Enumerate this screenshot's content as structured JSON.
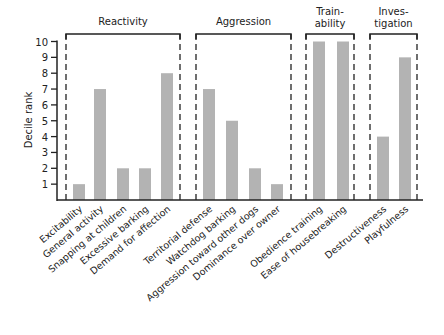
{
  "chart_data": {
    "type": "bar",
    "title": "",
    "xlabel": "",
    "ylabel": "Decile rank",
    "ylim": [
      0,
      10
    ],
    "yticks": [
      1,
      2,
      3,
      4,
      5,
      6,
      7,
      8,
      9,
      10
    ],
    "grid": false,
    "legend": null,
    "bar_color": "#b3b3b3",
    "groups": [
      {
        "name": "Reactivity",
        "label_lines": [
          "Reactivity"
        ],
        "categories": [
          "Excitability",
          "General activity",
          "Snapping at children",
          "Excessive barking",
          "Demand for affection"
        ],
        "values": [
          1,
          7,
          2,
          2,
          8
        ]
      },
      {
        "name": "Aggression",
        "label_lines": [
          "Aggression"
        ],
        "categories": [
          "Territorial defense",
          "Watchdog barking",
          "Aggression toward other dogs",
          "Dominance over owner"
        ],
        "values": [
          7,
          5,
          2,
          1
        ]
      },
      {
        "name": "Trainability",
        "label_lines": [
          "Train-",
          "ability"
        ],
        "categories": [
          "Obedience training",
          "Ease of housebreaking"
        ],
        "values": [
          10,
          10
        ]
      },
      {
        "name": "Investigation",
        "label_lines": [
          "Inves-",
          "tigation"
        ],
        "categories": [
          "Destructiveness",
          "Playfulness"
        ],
        "values": [
          4,
          9
        ]
      }
    ],
    "categories": [
      "Excitability",
      "General activity",
      "Snapping at children",
      "Excessive barking",
      "Demand for affection",
      "Territorial defense",
      "Watchdog barking",
      "Aggression toward other dogs",
      "Dominance over owner",
      "Obedience training",
      "Ease of housebreaking",
      "Destructiveness",
      "Playfulness"
    ],
    "values": [
      1,
      7,
      2,
      2,
      8,
      7,
      5,
      2,
      1,
      10,
      10,
      4,
      9
    ]
  },
  "layout": {
    "axis_x": 57,
    "baseline_y": 200,
    "unit_px": 15.85,
    "axis_end_x": 423,
    "bar_width": 12,
    "box_top_y": 34,
    "boxes": [
      {
        "left": 66,
        "right": 180,
        "label_y": [
          25
        ]
      },
      {
        "left": 196,
        "right": 291,
        "label_y": [
          25
        ]
      },
      {
        "left": 306,
        "right": 354,
        "label_y": [
          15,
          27
        ]
      },
      {
        "left": 370,
        "right": 417,
        "label_y": [
          15,
          27
        ]
      }
    ],
    "bar_x": [
      73,
      94,
      117,
      139,
      161,
      203,
      226,
      249,
      271,
      313,
      337,
      377,
      399
    ]
  }
}
